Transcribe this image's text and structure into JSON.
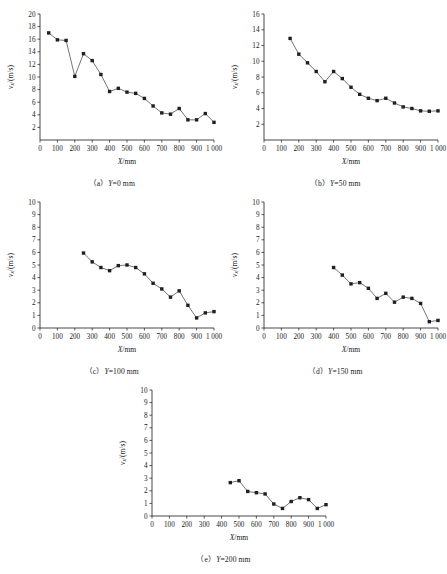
{
  "figure": {
    "name": "velocity-distribution-figure",
    "x_axis_label": "X/mm",
    "y_axis_label": "v_x/(m/s)",
    "y_axis_label_parts": {
      "symbol": "v",
      "subscript": "x",
      "units": "/(m/s)"
    },
    "x_axis_symbol": "X",
    "x_axis_units": "/mm"
  },
  "chart_data": [
    {
      "type": "line",
      "panel": "a",
      "caption": "（a）Y=0 mm",
      "caption_label": "（a）",
      "caption_cond": "Y",
      "caption_value": "=0 mm",
      "title": "",
      "xlabel": "X/mm",
      "ylabel": "v_x/(m/s)",
      "xlim": [
        0,
        1000
      ],
      "ylim": [
        0,
        20
      ],
      "xticks": [
        0,
        100,
        200,
        300,
        400,
        500,
        600,
        700,
        800,
        900,
        1000
      ],
      "xticklabels": [
        "0",
        "100",
        "200",
        "300",
        "400",
        "500",
        "600",
        "700",
        "800",
        "900",
        "1 000"
      ],
      "yticks": [
        2,
        4,
        6,
        8,
        10,
        12,
        14,
        16,
        18,
        20
      ],
      "yticklabels": [
        "2",
        "4",
        "6",
        "8",
        "10",
        "12",
        "14",
        "16",
        "18",
        "20"
      ],
      "grid": false,
      "legend": false,
      "x": [
        50,
        100,
        150,
        200,
        250,
        300,
        350,
        400,
        450,
        500,
        550,
        600,
        650,
        700,
        750,
        800,
        850,
        900,
        950,
        1000
      ],
      "y": [
        17.0,
        15.9,
        15.8,
        10.1,
        13.7,
        12.6,
        10.4,
        7.7,
        8.2,
        7.6,
        7.4,
        6.6,
        5.4,
        4.3,
        4.1,
        5.0,
        3.2,
        3.2,
        4.2,
        2.8
      ]
    },
    {
      "type": "line",
      "panel": "b",
      "caption": "（b）Y=50 mm",
      "caption_label": "（b）",
      "caption_cond": "Y",
      "caption_value": "=50 mm",
      "title": "",
      "xlabel": "X/mm",
      "ylabel": "v_x/(m/s)",
      "xlim": [
        0,
        1000
      ],
      "ylim": [
        0,
        16
      ],
      "xticks": [
        0,
        100,
        200,
        300,
        400,
        500,
        600,
        700,
        800,
        900,
        1000
      ],
      "xticklabels": [
        "0",
        "100",
        "200",
        "300",
        "400",
        "500",
        "600",
        "700",
        "800",
        "900",
        "1 000"
      ],
      "yticks": [
        2,
        4,
        6,
        8,
        10,
        12,
        14,
        16
      ],
      "yticklabels": [
        "2",
        "4",
        "6",
        "8",
        "10",
        "12",
        "14",
        "16"
      ],
      "grid": false,
      "legend": false,
      "x": [
        150,
        200,
        250,
        300,
        350,
        400,
        450,
        500,
        550,
        600,
        650,
        700,
        750,
        800,
        850,
        900,
        950,
        1000
      ],
      "y": [
        12.9,
        10.9,
        9.8,
        8.7,
        7.4,
        8.7,
        7.8,
        6.7,
        5.8,
        5.3,
        5.0,
        5.3,
        4.7,
        4.2,
        4.0,
        3.7,
        3.65,
        3.7
      ]
    },
    {
      "type": "line",
      "panel": "c",
      "caption": "（c）Y=100 mm",
      "caption_label": "（c）",
      "caption_cond": "Y",
      "caption_value": "=100 mm",
      "title": "",
      "xlabel": "X/mm",
      "ylabel": "v_x/(m/s)",
      "xlim": [
        0,
        1000
      ],
      "ylim": [
        0,
        10
      ],
      "xticks": [
        0,
        100,
        200,
        300,
        400,
        500,
        600,
        700,
        800,
        900,
        1000
      ],
      "xticklabels": [
        "0",
        "100",
        "200",
        "300",
        "400",
        "500",
        "600",
        "700",
        "800",
        "900",
        "1 000"
      ],
      "yticks": [
        0,
        1,
        2,
        3,
        4,
        5,
        6,
        7,
        8,
        9,
        10
      ],
      "yticklabels": [
        "0",
        "1",
        "2",
        "3",
        "4",
        "5",
        "6",
        "7",
        "8",
        "9",
        "10"
      ],
      "grid": false,
      "legend": false,
      "x": [
        250,
        300,
        350,
        400,
        450,
        500,
        550,
        600,
        650,
        700,
        750,
        800,
        850,
        900,
        950,
        1000
      ],
      "y": [
        5.95,
        5.25,
        4.8,
        4.55,
        4.95,
        5.0,
        4.8,
        4.3,
        3.55,
        3.1,
        2.45,
        2.95,
        1.8,
        0.8,
        1.2,
        1.3
      ]
    },
    {
      "type": "line",
      "panel": "d",
      "caption": "（d）Y=150 mm",
      "caption_label": "（d）",
      "caption_cond": "Y",
      "caption_value": "=150 mm",
      "title": "",
      "xlabel": "X/mm",
      "ylabel": "v_x/(m/s)",
      "xlim": [
        0,
        1000
      ],
      "ylim": [
        0,
        10
      ],
      "xticks": [
        0,
        100,
        200,
        300,
        400,
        500,
        600,
        700,
        800,
        900,
        1000
      ],
      "xticklabels": [
        "0",
        "100",
        "200",
        "300",
        "400",
        "500",
        "600",
        "700",
        "800",
        "900",
        "1 000"
      ],
      "yticks": [
        0,
        1,
        2,
        3,
        4,
        5,
        6,
        7,
        8,
        9,
        10
      ],
      "yticklabels": [
        "0",
        "1",
        "2",
        "3",
        "4",
        "5",
        "6",
        "7",
        "8",
        "9",
        "10"
      ],
      "grid": false,
      "legend": false,
      "x": [
        400,
        450,
        500,
        550,
        600,
        650,
        700,
        750,
        800,
        850,
        900,
        950,
        1000
      ],
      "y": [
        4.8,
        4.2,
        3.5,
        3.6,
        3.15,
        2.35,
        2.75,
        2.05,
        2.45,
        2.35,
        1.95,
        0.5,
        0.6
      ]
    },
    {
      "type": "line",
      "panel": "e",
      "caption": "（e）Y=200 mm",
      "caption_label": "（e）",
      "caption_cond": "Y",
      "caption_value": "=200 mm",
      "title": "",
      "xlabel": "X/mm",
      "ylabel": "v_x/(m/s)",
      "xlim": [
        0,
        1000
      ],
      "ylim": [
        0,
        10
      ],
      "xticks": [
        0,
        100,
        200,
        300,
        400,
        500,
        600,
        700,
        800,
        900,
        1000
      ],
      "xticklabels": [
        "0",
        "100",
        "200",
        "300",
        "400",
        "500",
        "600",
        "700",
        "800",
        "900",
        "1 000"
      ],
      "yticks": [
        0,
        1,
        2,
        3,
        4,
        5,
        6,
        7,
        8,
        9,
        10
      ],
      "yticklabels": [
        "0",
        "1",
        "2",
        "3",
        "4",
        "5",
        "6",
        "7",
        "8",
        "9",
        "10"
      ],
      "grid": false,
      "legend": false,
      "x": [
        450,
        500,
        550,
        600,
        650,
        700,
        750,
        800,
        850,
        900,
        950,
        1000
      ],
      "y": [
        2.65,
        2.8,
        1.95,
        1.85,
        1.75,
        0.95,
        0.6,
        1.15,
        1.45,
        1.3,
        0.6,
        0.9
      ]
    }
  ]
}
